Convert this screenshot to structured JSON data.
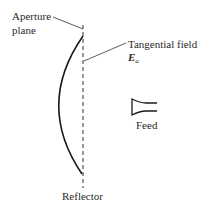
{
  "diagram": {
    "labels": {
      "aperture_line1": "Aperture",
      "aperture_line2": "plane",
      "tangential": "Tangential field",
      "field_symbol": "E",
      "field_subscript": "a",
      "feed": "Feed",
      "reflector": "Reflector"
    },
    "colors": {
      "stroke": "#1a1a1a",
      "background": "#ffffff"
    }
  }
}
